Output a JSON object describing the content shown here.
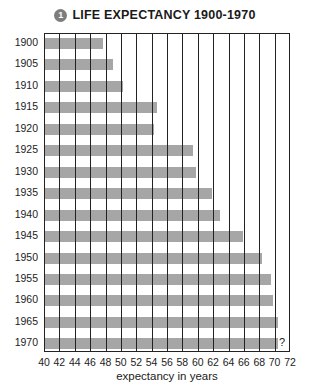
{
  "title": {
    "badge": "1",
    "text": "LIFE EXPECTANCY 1900-1970"
  },
  "chart_data": {
    "type": "bar",
    "orientation": "horizontal",
    "title": "LIFE EXPECTANCY 1900-1970",
    "xlabel": "expectancy in years",
    "ylabel": "",
    "categories": [
      "1900",
      "1905",
      "1910",
      "1915",
      "1920",
      "1925",
      "1930",
      "1935",
      "1940",
      "1945",
      "1950",
      "1955",
      "1960",
      "1965",
      "1970"
    ],
    "values": [
      47.5,
      48.8,
      50.1,
      54.6,
      54.2,
      59.2,
      59.7,
      61.7,
      62.8,
      65.8,
      68.2,
      69.4,
      69.6,
      70.3,
      70.3
    ],
    "xlim": [
      40,
      72
    ],
    "x_ticks": [
      40,
      42,
      44,
      46,
      48,
      50,
      52,
      54,
      56,
      58,
      60,
      62,
      64,
      66,
      68,
      70,
      72
    ],
    "grid": "vertical lines every 2 years",
    "annotations": [
      {
        "category": "1970",
        "text": "?"
      }
    ],
    "bar_color": "#a6a6a6",
    "legend": null
  }
}
